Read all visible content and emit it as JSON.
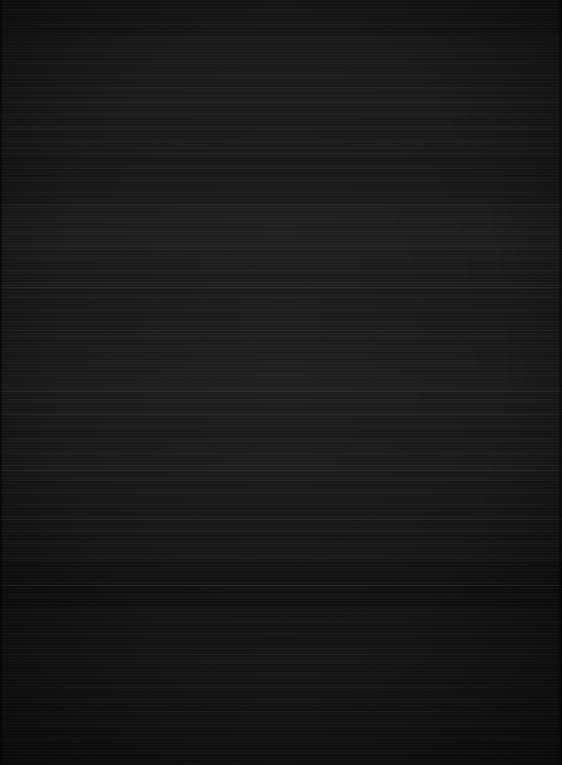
{
  "capture": {
    "kind": "near-black-screen",
    "width": 562,
    "height": 765,
    "description": "Almost entirely black screen capture with faint horizontal banding; no legible text, icons or UI chrome at any zoom level",
    "legible_text": "",
    "background_color": "#121212",
    "band_color": "#1e1e1e",
    "divider_color": "#2a2a2a"
  },
  "bands": [
    {
      "name": "band-top",
      "y": 0,
      "height": 38,
      "shade": "#141414"
    },
    {
      "name": "band-upper-light",
      "y": 38,
      "height": 58,
      "shade": "#1a1a1a"
    },
    {
      "name": "band-upper-mid",
      "y": 96,
      "height": 54,
      "shade": "#1b1b1b"
    },
    {
      "name": "band-mid-dark",
      "y": 150,
      "height": 55,
      "shade": "#171717"
    },
    {
      "name": "band-mid-light",
      "y": 205,
      "height": 45,
      "shade": "#1e1e1e"
    },
    {
      "name": "band-center",
      "y": 250,
      "height": 80,
      "shade": "#1a1a1a"
    },
    {
      "name": "band-lower-mid",
      "y": 330,
      "height": 60,
      "shade": "#1c1c1c"
    },
    {
      "name": "band-lower",
      "y": 390,
      "height": 80,
      "shade": "#191919"
    },
    {
      "name": "band-lower-dark",
      "y": 470,
      "height": 90,
      "shade": "#151515"
    },
    {
      "name": "band-footer-dark",
      "y": 560,
      "height": 50,
      "shade": "#101010"
    },
    {
      "name": "band-footer",
      "y": 610,
      "height": 85,
      "shade": "#141414"
    },
    {
      "name": "band-bottom",
      "y": 695,
      "height": 70,
      "shade": "#121212"
    }
  ],
  "dividers": [
    {
      "name": "divider-1",
      "y": 95,
      "weight": "soft"
    },
    {
      "name": "divider-2",
      "y": 148,
      "weight": "soft"
    },
    {
      "name": "divider-3",
      "y": 204,
      "weight": "soft"
    },
    {
      "name": "divider-4",
      "y": 249,
      "weight": "soft"
    },
    {
      "name": "divider-5",
      "y": 287,
      "weight": "strong"
    },
    {
      "name": "divider-6",
      "y": 330,
      "weight": "soft"
    },
    {
      "name": "divider-7",
      "y": 391,
      "weight": "strong"
    },
    {
      "name": "divider-8",
      "y": 414,
      "weight": "soft"
    },
    {
      "name": "divider-9",
      "y": 470,
      "weight": "strong"
    },
    {
      "name": "divider-10",
      "y": 519,
      "weight": "soft"
    },
    {
      "name": "divider-11",
      "y": 560,
      "weight": "soft"
    },
    {
      "name": "divider-12",
      "y": 585,
      "weight": "strong"
    },
    {
      "name": "divider-13",
      "y": 613,
      "weight": "soft"
    },
    {
      "name": "divider-14",
      "y": 654,
      "weight": "soft"
    },
    {
      "name": "divider-15",
      "y": 722,
      "weight": "soft"
    }
  ]
}
